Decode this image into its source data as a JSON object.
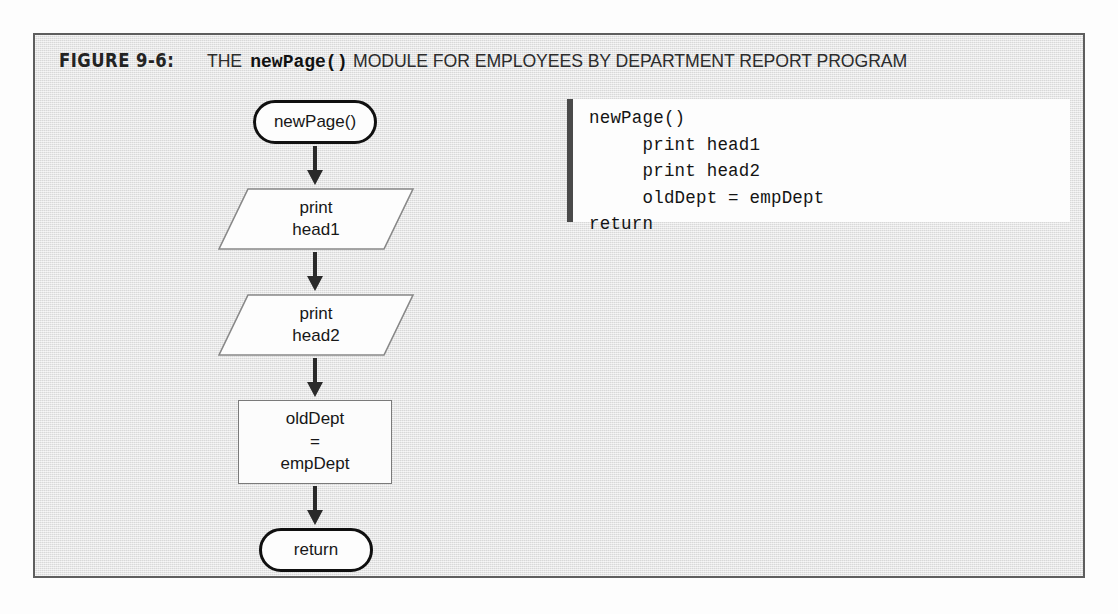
{
  "figure": {
    "label": "FIGURE 9-6:",
    "caption_before": "THE",
    "caption_code": "newPage()",
    "caption_after": "MODULE FOR EMPLOYEES BY DEPARTMENT REPORT PROGRAM",
    "frame_color": "#5e5e5e",
    "background_color": "#e6e6e6"
  },
  "flowchart": {
    "type": "flowchart",
    "nodes": [
      {
        "id": "start",
        "shape": "terminator",
        "text": "newPage()"
      },
      {
        "id": "out1",
        "shape": "parallelogram",
        "text": "print\nhead1"
      },
      {
        "id": "out2",
        "shape": "parallelogram",
        "text": "print\nhead2"
      },
      {
        "id": "assign",
        "shape": "rectangle",
        "text": "oldDept\n=\nempDept"
      },
      {
        "id": "end",
        "shape": "terminator",
        "text": "return"
      }
    ],
    "edges": [
      {
        "from": "start",
        "to": "out1",
        "arrow": "down"
      },
      {
        "from": "out1",
        "to": "out2",
        "arrow": "down"
      },
      {
        "from": "out2",
        "to": "assign",
        "arrow": "down"
      },
      {
        "from": "assign",
        "to": "end",
        "arrow": "down"
      }
    ]
  },
  "code_panel": {
    "language": "pseudocode",
    "lines": [
      "newPage()",
      "     print head1",
      "     print head2",
      "     oldDept = empDept",
      "return"
    ],
    "text": "newPage()\n     print head1\n     print head2\n     oldDept = empDept\nreturn",
    "rule_color": "#4a4a4a"
  }
}
